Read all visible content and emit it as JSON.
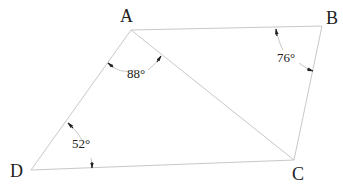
{
  "diagram": {
    "type": "quadrilateral",
    "vertices": [
      {
        "name": "A",
        "x": 131,
        "y": 30,
        "label_x": 120,
        "label_y": 22
      },
      {
        "name": "B",
        "x": 322,
        "y": 26,
        "label_x": 326,
        "label_y": 24
      },
      {
        "name": "C",
        "x": 294,
        "y": 160,
        "label_x": 292,
        "label_y": 180
      },
      {
        "name": "D",
        "x": 31,
        "y": 170,
        "label_x": 10,
        "label_y": 177
      }
    ],
    "edges": [
      "AB",
      "BC",
      "CD",
      "DA"
    ],
    "diagonals": [
      "AC"
    ],
    "angles": [
      {
        "at": "A",
        "between": "DAC",
        "label": "88°"
      },
      {
        "at": "B",
        "between": "ABC",
        "label": "76°"
      },
      {
        "at": "D",
        "between": "ADC",
        "label": "52°"
      }
    ],
    "line_color": "#c8c8c8"
  }
}
